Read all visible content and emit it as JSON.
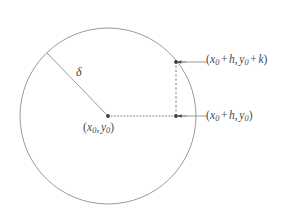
{
  "figure": {
    "type": "geometric-diagram",
    "background_color": "#ffffff",
    "stroke_color": "#8a8a8a",
    "text_color": "#4a4a4a"
  },
  "circle": {
    "center_x": 108,
    "center_y": 116,
    "radius": 88,
    "stroke": "#8f8f8f",
    "stroke_width": 0.9,
    "fill": "none"
  },
  "radius_line": {
    "from_x": 108,
    "from_y": 116,
    "to_x": 47,
    "to_y": 53,
    "stroke": "#8f8f8f",
    "stroke_width": 0.9
  },
  "horizontal_dotted_line": {
    "from_x": 108,
    "from_y": 116,
    "to_x": 176,
    "to_y": 116,
    "dash_pattern": "1,2.2",
    "stroke": "#6f6f6f"
  },
  "vertical_dashed_line": {
    "from_x": 176,
    "from_y": 116,
    "to_x": 176,
    "to_y": 62,
    "dash_pattern": "2.2,2.2",
    "stroke": "#6f6f6f"
  },
  "points": [
    {
      "name": "center-point",
      "x": 108,
      "y": 116,
      "radius": 1.9
    },
    {
      "name": "offset-point",
      "x": 176,
      "y": 116,
      "radius": 1.9
    },
    {
      "name": "corner-point",
      "x": 176,
      "y": 62,
      "radius": 1.9
    }
  ],
  "arrows": [
    {
      "name": "top-arrow",
      "tip_x": 177,
      "tip_y": 62,
      "tail_x": 186,
      "tail_y": 62
    },
    {
      "name": "bottom-arrow",
      "tip_x": 177,
      "tip_y": 116,
      "tail_x": 187,
      "tail_y": 116
    }
  ],
  "leader_lines": [
    {
      "name": "top-leader",
      "from_x": 186,
      "from_y": 62,
      "to_x": 207,
      "to_y": 62
    },
    {
      "name": "bottom-leader",
      "from_x": 187,
      "from_y": 116,
      "to_x": 207,
      "to_y": 116
    }
  ],
  "labels": {
    "delta": "δ",
    "top_corner": {
      "full_text": "(x₀ + h, y₀ + k)",
      "open_paren": "(",
      "var_x": "x",
      "sub_0_a": "0",
      "plus_1": "+",
      "var_h": "h",
      "comma": ",",
      "var_y": "y",
      "sub_0_b": "0",
      "plus_2": "+",
      "var_k": "k",
      "close_paren": ")"
    },
    "right_point": {
      "full_text": "(x₀ + h, y₀)",
      "open_paren": "(",
      "var_x": "x",
      "sub_0_a": "0",
      "plus_1": "+",
      "var_h": "h",
      "comma": ",",
      "var_y": "y",
      "sub_0_b": "0",
      "close_paren": ")"
    },
    "center": {
      "full_text": "(x₀, y₀)",
      "open_paren": "(",
      "var_x": "x",
      "sub_0_a": "0",
      "comma": ",",
      "var_y": "y",
      "sub_0_b": "0",
      "close_paren": ")"
    }
  }
}
